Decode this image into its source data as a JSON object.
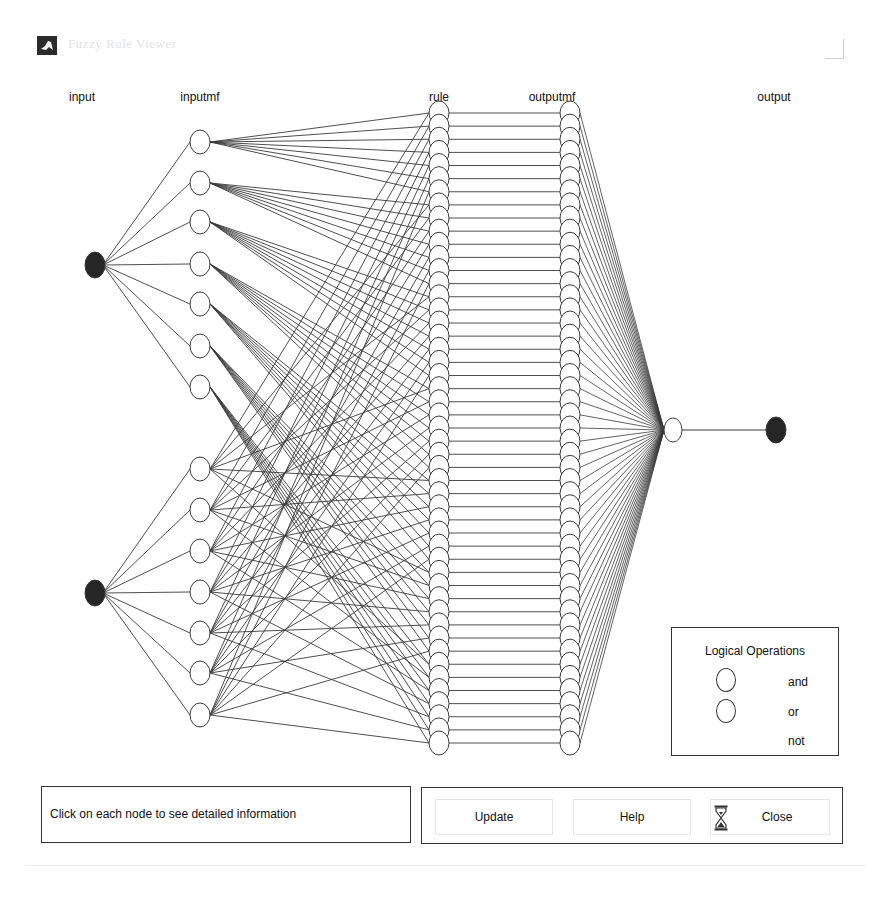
{
  "window": {
    "title": "Fuzzy Rule Viewer",
    "icon": "matlab-logo-icon"
  },
  "columns": {
    "input": {
      "label": "input",
      "x": 95
    },
    "inputmf": {
      "label": "inputmf",
      "x": 200
    },
    "rule": {
      "label": "rule",
      "x": 439
    },
    "outputmf": {
      "label": "outputmf",
      "x": 570
    },
    "output": {
      "label": "output",
      "x": 776
    }
  },
  "network": {
    "inputs": [
      {
        "name": "input1",
        "y": 265,
        "filled": true
      },
      {
        "name": "input2",
        "y": 593,
        "filled": true
      }
    ],
    "inputmf_groups": [
      {
        "input_index": 0,
        "ys": [
          142,
          183,
          222,
          264,
          304,
          346,
          387
        ]
      },
      {
        "input_index": 1,
        "ys": [
          469,
          510,
          551,
          592,
          633,
          673,
          715
        ]
      }
    ],
    "rule_count": 49,
    "rule_top_y": 113,
    "rule_bottom_y": 743,
    "aggregation_node": {
      "x": 673,
      "y": 430
    },
    "output_node": {
      "x": 776,
      "y": 430,
      "filled": true
    },
    "stroke_color": "#3a3a3a",
    "fill_color": "#262626"
  },
  "legend": {
    "title": "Logical Operations",
    "items": [
      {
        "label": "and",
        "symbol": "circle"
      },
      {
        "label": "or",
        "symbol": "circle"
      },
      {
        "label": "not",
        "symbol": "none"
      }
    ]
  },
  "info_panel": {
    "text": "Click on each node to see detailed information"
  },
  "buttons": {
    "update": "Update",
    "help": "Help",
    "close": "Close",
    "close_icon": "hourglass-icon"
  }
}
